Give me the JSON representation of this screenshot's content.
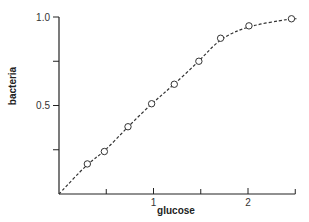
{
  "chart_data": {
    "type": "line",
    "title": "",
    "xlabel": "glucose",
    "ylabel": "bacteria",
    "xlim": [
      0,
      2.5
    ],
    "ylim": [
      0,
      1.0
    ],
    "x_ticks": [
      0.5,
      1,
      1.5,
      2,
      2.5
    ],
    "x_tick_labels": [
      "",
      "1",
      "",
      "2",
      ""
    ],
    "y_ticks": [
      0.25,
      0.5,
      0.75,
      1.0
    ],
    "y_tick_labels": [
      "",
      "0.5",
      "",
      "1.0"
    ],
    "grid": false,
    "legend": null,
    "series": [
      {
        "name": "bacteria",
        "style": "dashed line with open circle markers",
        "line_start": [
          0,
          0
        ],
        "x": [
          0.3,
          0.48,
          0.73,
          0.98,
          1.22,
          1.48,
          1.71,
          2.01,
          2.46
        ],
        "y": [
          0.17,
          0.24,
          0.38,
          0.51,
          0.62,
          0.75,
          0.88,
          0.95,
          0.99
        ]
      }
    ],
    "colors": {
      "line": "#333333",
      "axis": "#222222",
      "marker_fill": "#ffffff"
    }
  }
}
